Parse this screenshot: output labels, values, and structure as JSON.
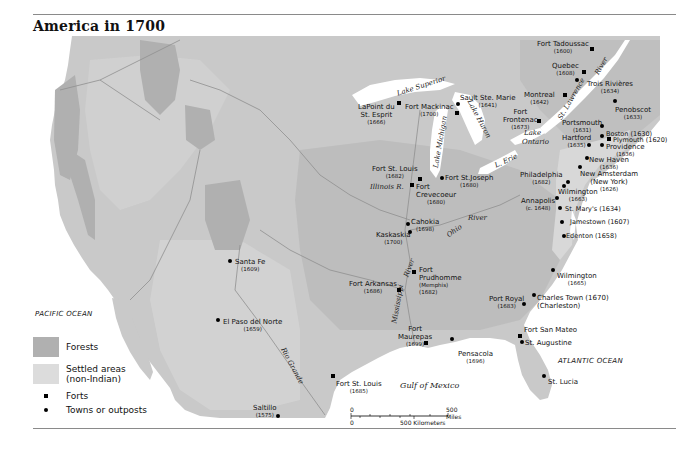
{
  "title": "America in 1700",
  "colors": {
    "land": "#c9c9c9",
    "forest": "#b0b0b0",
    "settled": "#dcdcdc",
    "water": "#ffffff",
    "rivers": "#8f8f8f"
  },
  "oceans": {
    "pacific": "PACIFIC OCEAN",
    "atlantic": "ATLANTIC OCEAN",
    "gulf": "Gulf of Mexico"
  },
  "water_labels": {
    "lake_superior": "Lake Superior",
    "lake_michigan": "Lake Michigan",
    "lake_huron": "Lake Huron",
    "lake_erie": "L. Erie",
    "lake_ontario_1": "Lake",
    "lake_ontario_2": "Ontario",
    "st_lawrence": "St. Lawrence",
    "st_lawrence_river": "River",
    "illinois": "Illinois R.",
    "ohio": "Ohio",
    "ohio_river": "River",
    "mississippi": "Mississippi",
    "mississippi_river": "River",
    "rio_grande": "Rio Grande"
  },
  "places": {
    "fort_tadoussac": {
      "name": "Fort Tadoussac",
      "year": "(1600)"
    },
    "quebec": {
      "name": "Quebec",
      "year": "(1608)"
    },
    "trois_rivieres": {
      "name": "Trois Rivières",
      "year": "(1634)"
    },
    "montreal": {
      "name": "Montreal",
      "year": "(1642)"
    },
    "penobscot": {
      "name": "Penobscot",
      "year": "(1633)"
    },
    "fort_frontenac_1": {
      "name": "Fort",
      "name2": "Frontenac",
      "year": "(1673)"
    },
    "portsmouth": {
      "name": "Portsmouth",
      "year": "(1631)"
    },
    "boston": {
      "name": "Boston (1630)"
    },
    "plymouth": {
      "name": "Plymouth (1620)"
    },
    "hartford": {
      "name": "Hartford",
      "year": "(1635)"
    },
    "providence": {
      "name": "Providence",
      "year": "(1636)"
    },
    "new_haven": {
      "name": "New Haven",
      "year": "(1636)"
    },
    "new_amsterdam": {
      "name": "New Amsterdam",
      "name2": "(New York)",
      "year": "(1626)"
    },
    "philadelphia": {
      "name": "Philadelphia",
      "year": "(1682)"
    },
    "wilmington_de": {
      "name": "Wilmington",
      "year": "(1663)"
    },
    "annapolis": {
      "name": "Annapolis",
      "year": "(c. 1648)"
    },
    "st_marys": {
      "name": "St. Mary's (1634)"
    },
    "jamestown": {
      "name": "Jamestown (1607)"
    },
    "edenton": {
      "name": "Edenton (1658)"
    },
    "wilmington_nc": {
      "name": "Wilmington",
      "year": "(1665)"
    },
    "charles_town": {
      "name": "Charles Town (1670)",
      "name2": "(Charleston)"
    },
    "port_royal": {
      "name": "Port Royal",
      "year": "(1683)"
    },
    "fort_san_mateo": {
      "name": "Fort San Mateo"
    },
    "st_augustine": {
      "name": "St. Augustine"
    },
    "st_lucia": {
      "name": "St. Lucia"
    },
    "pensacola": {
      "name": "Pensacola",
      "year": "(1696)"
    },
    "fort_maurepas": {
      "name": "Fort",
      "name2": "Maurepas",
      "year": "(1699)"
    },
    "fort_st_louis_tx": {
      "name": "Fort St. Louis",
      "year": "(1685)"
    },
    "saltillo": {
      "name": "Saltillo",
      "year": "(1575)"
    },
    "el_paso": {
      "name": "El Paso del Norte",
      "year": "(1659)"
    },
    "santa_fe": {
      "name": "Santa Fe",
      "year": "(1609)"
    },
    "fort_arkansas": {
      "name": "Fort Arkansas",
      "year": "(1686)"
    },
    "fort_prudhomme": {
      "name": "Fort",
      "name2": "Prudhomme",
      "name3": "(Memphis)",
      "year": "(1682)"
    },
    "kaskaskia": {
      "name": "Kaskaskia",
      "year": "(1700)"
    },
    "cahokia": {
      "name": "Cahokia",
      "year": "(1698)"
    },
    "fort_crevecoeur": {
      "name": "Fort",
      "name2": "Crevecoeur",
      "year": "(1680)"
    },
    "fort_st_louis_il": {
      "name": "Fort St. Louis",
      "year": "(1682)"
    },
    "fort_st_joseph": {
      "name": "Fort St.Joseph",
      "year": "(1680)"
    },
    "lapointe": {
      "name": "LaPoint du",
      "name2": "St. Esprit",
      "year": "(1666)"
    },
    "fort_mackinac": {
      "name": "Fort Mackinac",
      "year": "(1700)"
    },
    "sault_ste_marie": {
      "name": "Sault Ste. Marie",
      "year": "(1641)"
    }
  },
  "legend": {
    "forests": "Forests",
    "settled_1": "Settled areas",
    "settled_2": "(non-Indian)",
    "forts": "Forts",
    "towns": "Towns or outposts"
  },
  "scale": {
    "zero_top": "0",
    "zero_bottom": "0",
    "miles": "500 Miles",
    "km": "500 Kilometers"
  }
}
